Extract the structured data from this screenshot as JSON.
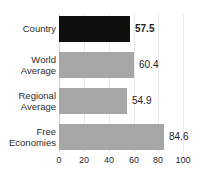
{
  "chart_data": {
    "type": "bar",
    "orientation": "horizontal",
    "title": "",
    "xlabel": "",
    "ylabel": "",
    "xlim": [
      0,
      100
    ],
    "xticks": [
      "0",
      "20",
      "40",
      "60",
      "80",
      "100"
    ],
    "grid": true,
    "legend": "none",
    "categories": [
      "Country",
      "World\nAverage",
      "Regional\nAverage",
      "Free\nEconomies"
    ],
    "values": [
      57.5,
      60.4,
      54.9,
      84.6
    ],
    "value_labels": [
      "57.5",
      "60.4",
      "54.9",
      "84.6"
    ],
    "bar_colors": [
      "#100f0d",
      "#a7a7a7",
      "#a7a7a7",
      "#a7a7a7"
    ],
    "highlight_index": 0,
    "colors": {
      "highlight": "#100f0d",
      "default_bar": "#a7a7a7",
      "gridline": "#e9e9e9",
      "axis": "#cfcfcf",
      "text": "#2b2b2b"
    }
  }
}
